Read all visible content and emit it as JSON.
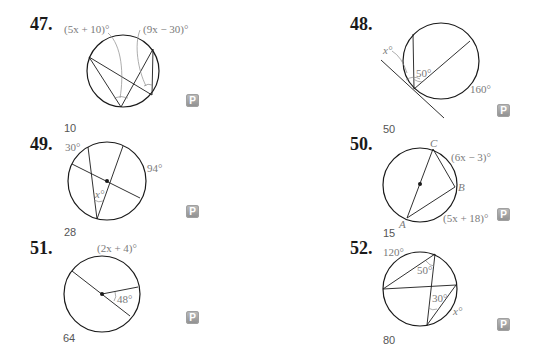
{
  "problems": [
    {
      "number": "47.",
      "labels": {
        "arc_left": "(5x + 10)°",
        "arc_right": "(9x − 30)°"
      },
      "answer": "10",
      "badge": "P"
    },
    {
      "number": "48.",
      "labels": {
        "angle_x": "x°",
        "angle": "50°",
        "arc": "160°"
      },
      "answer": "50",
      "badge": "P"
    },
    {
      "number": "49.",
      "labels": {
        "arc_top": "30°",
        "arc_right": "94°",
        "angle_x": "x°"
      },
      "answer": "28",
      "badge": "P"
    },
    {
      "number": "50.",
      "labels": {
        "C": "C",
        "B": "B",
        "A": "A",
        "arc_cb": "(6x − 3)°",
        "arc_ba": "(5x + 18)°"
      },
      "answer": "15",
      "badge": "P"
    },
    {
      "number": "51.",
      "labels": {
        "arc_top": "(2x + 4)°",
        "angle": "48°"
      },
      "answer": "64",
      "badge": "P"
    },
    {
      "number": "52.",
      "labels": {
        "arc_top": "120°",
        "angle_top": "50°",
        "angle_mid": "30°",
        "arc_x": "x°"
      },
      "answer": "80",
      "badge": "P"
    }
  ]
}
